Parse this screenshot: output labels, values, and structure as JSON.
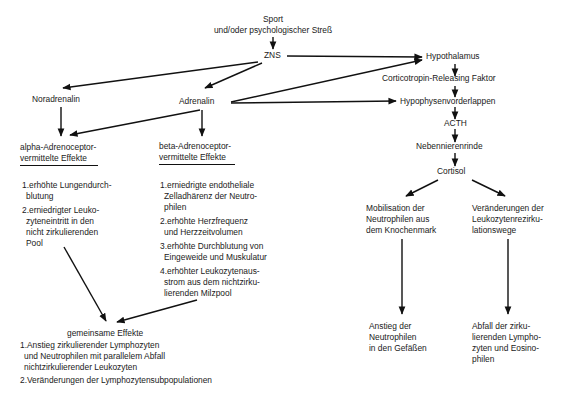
{
  "diagram": {
    "nodes": {
      "trigger": [
        "Sport",
        "und/oder psychologischer Streß"
      ],
      "zns": "ZNS",
      "hypothalamus": "Hypothalamus",
      "crf": "Corticotropin-Releasing Faktor",
      "hvl": "Hypophysenvorderlappen",
      "acth": "ACTH",
      "nnr": "Nebennierenrinde",
      "cortisol": "Cortisol",
      "noradrenalin": "Noradrenalin",
      "adrenalin": "Adrenalin",
      "alpha": [
        "alpha-Adrenoceptor-",
        "vermittelte Effekte"
      ],
      "beta": [
        "beta-Adrenoceptor-",
        "vermittelte Effekte"
      ],
      "mobilisation": [
        "Mobilisation der",
        "Neutrophilen aus",
        "dem Knochenmark"
      ],
      "rezirkulation": [
        "Veränderungen der",
        "Leukozytenrezirku-",
        "lationswege"
      ],
      "anstieg": [
        "Anstieg der",
        "Neutrophilen",
        "in den Gefäßen"
      ],
      "abfall": [
        "Abfall der zirku-",
        "lierenden Lympho-",
        "zyten und Eosino-",
        "philen"
      ],
      "gemeinsam_title": "gemeinsame Effekte"
    },
    "alpha_effects": [
      {
        "num": "1.",
        "lines": [
          "erhöhte Lungendurch-",
          "blutung"
        ]
      },
      {
        "num": "2.",
        "lines": [
          "erniedrigter Leuko-",
          "zyteneintritt in den",
          "nicht zirkulierenden",
          "Pool"
        ]
      }
    ],
    "beta_effects": [
      {
        "num": "1.",
        "lines": [
          "erniedrigte endotheliale",
          "Zelladhärenz der Neutro-",
          "philen"
        ]
      },
      {
        "num": "2.",
        "lines": [
          "erhöhte Herzfrequenz",
          "und Herzzeitvolumen"
        ]
      },
      {
        "num": "3.",
        "lines": [
          "erhöhte Durchblutung von",
          "Eingeweide und Muskulatur"
        ]
      },
      {
        "num": "4.",
        "lines": [
          "erhöhter Leukozytenaus-",
          "strom aus dem nichtzirku-",
          "lierenden Milzpool"
        ]
      }
    ],
    "common_effects": [
      {
        "num": "1.",
        "lines": [
          "Anstieg zirkulierender Lymphozyten",
          "und Neutrophilen mit parallelem Abfall",
          "nichtzirkulierender Leukozyten"
        ]
      },
      {
        "num": "2.",
        "lines": [
          "Veränderungen der Lymphozytensubpopulationen"
        ]
      }
    ],
    "edges": [
      {
        "from": "trigger",
        "to": "zns"
      },
      {
        "from": "zns",
        "to": "hypothalamus"
      },
      {
        "from": "zns",
        "to": "noradrenalin"
      },
      {
        "from": "zns",
        "to": "adrenalin"
      },
      {
        "from": "adrenalin",
        "to": "hypothalamus"
      },
      {
        "from": "adrenalin",
        "to": "hvl"
      },
      {
        "from": "adrenalin",
        "to": "alpha"
      },
      {
        "from": "adrenalin",
        "to": "beta"
      },
      {
        "from": "noradrenalin",
        "to": "alpha"
      },
      {
        "from": "hypothalamus",
        "to": "crf"
      },
      {
        "from": "crf",
        "to": "hvl"
      },
      {
        "from": "hvl",
        "to": "acth"
      },
      {
        "from": "acth",
        "to": "nnr"
      },
      {
        "from": "nnr",
        "to": "cortisol"
      },
      {
        "from": "cortisol",
        "to": "mobilisation"
      },
      {
        "from": "cortisol",
        "to": "rezirkulation"
      },
      {
        "from": "mobilisation",
        "to": "anstieg"
      },
      {
        "from": "rezirkulation",
        "to": "abfall"
      },
      {
        "from": "alpha",
        "to": "gemeinsam"
      },
      {
        "from": "beta",
        "to": "gemeinsam"
      }
    ]
  }
}
